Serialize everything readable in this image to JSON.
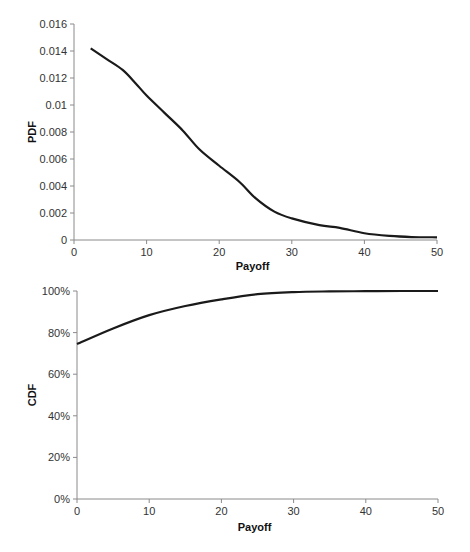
{
  "chart_data": [
    {
      "type": "line",
      "title": "",
      "xlabel": "Payoff",
      "ylabel": "PDF",
      "xlim": [
        0,
        50
      ],
      "ylim": [
        0,
        0.016
      ],
      "xticks": [
        "0",
        "10",
        "20",
        "30",
        "40",
        "50"
      ],
      "yticks": [
        "0",
        "0.002",
        "0.004",
        "0.006",
        "0.008",
        "0.01",
        "0.012",
        "0.014",
        "0.016"
      ],
      "grid": false,
      "legend": null,
      "series": [
        {
          "name": "PDF",
          "x": [
            2.3,
            4.5,
            6.7,
            8.5,
            10,
            12.5,
            15,
            17.3,
            20,
            22.8,
            25,
            27.6,
            30,
            33.8,
            36.6,
            40,
            43.5,
            46.5,
            50
          ],
          "values": [
            0.0142,
            0.0134,
            0.0126,
            0.0116,
            0.0107,
            0.0094,
            0.0081,
            0.0067,
            0.0055,
            0.0043,
            0.0031,
            0.0021,
            0.0016,
            0.0011,
            0.0009,
            0.0005,
            0.0003,
            0.00022,
            0.0002
          ]
        }
      ]
    },
    {
      "type": "line",
      "title": "",
      "xlabel": "Payoff",
      "ylabel": "CDF",
      "xlim": [
        0,
        50
      ],
      "ylim": [
        0,
        100
      ],
      "xticks": [
        "0",
        "10",
        "20",
        "30",
        "40",
        "50"
      ],
      "yticks": [
        "0%",
        "20%",
        "40%",
        "60%",
        "80%",
        "100%"
      ],
      "grid": false,
      "legend": null,
      "series": [
        {
          "name": "CDF",
          "x": [
            0,
            5,
            10,
            15,
            20,
            25,
            30,
            35,
            40,
            45,
            50
          ],
          "values": [
            74.5,
            82,
            88.4,
            92.8,
            96,
            98.5,
            99.5,
            99.8,
            99.9,
            100,
            100
          ]
        }
      ]
    }
  ]
}
